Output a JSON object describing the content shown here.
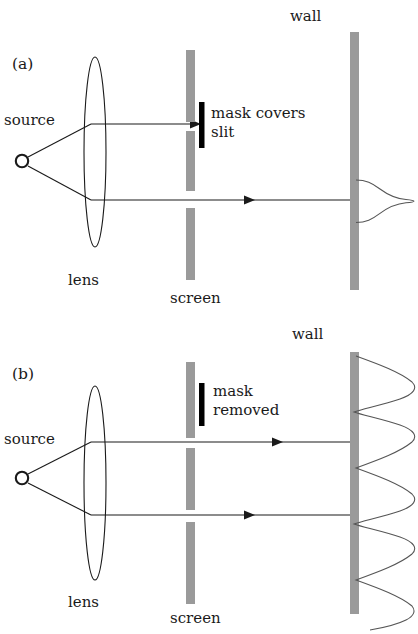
{
  "figure": {
    "type": "optics-diagram",
    "title_present": false,
    "colors": {
      "screen_gray": "#9a9a9a",
      "wall_gray": "#9a9a9a",
      "mask_black": "#000000",
      "ray_line": "#1a1a1a",
      "curve_line": "#555555",
      "text": "#1a1a1a",
      "background": "#ffffff"
    }
  },
  "panels": [
    {
      "id": "a",
      "label": "(a)",
      "source_label": "source",
      "lens_label": "lens",
      "screen_label": "screen",
      "wall_label": "wall",
      "mask_label_line1": "mask covers",
      "mask_label_line2": "slit",
      "mask_state": "covering-upper-slit",
      "rays": 2,
      "blocked_rays": 1,
      "pattern": {
        "kind": "gaussian",
        "peaks": 1,
        "description": "single broad diffraction peak"
      },
      "screen_segments": 2,
      "slits_open": 1
    },
    {
      "id": "b",
      "label": "(b)",
      "source_label": "source",
      "lens_label": "lens",
      "screen_label": "screen",
      "wall_label": "wall",
      "mask_label_line1": "mask",
      "mask_label_line2": "removed",
      "mask_state": "removed-set-aside",
      "rays": 2,
      "blocked_rays": 0,
      "pattern": {
        "kind": "interference-fringes",
        "peaks": 6,
        "description": "oscillating two-slit interference fringes"
      },
      "screen_segments": 3,
      "slits_open": 2
    }
  ]
}
